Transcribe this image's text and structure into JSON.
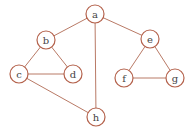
{
  "graph": {
    "nodes": [
      {
        "id": "a",
        "label": "a",
        "x": 95,
        "y": 14
      },
      {
        "id": "b",
        "label": "b",
        "x": 46,
        "y": 40
      },
      {
        "id": "c",
        "label": "c",
        "x": 19,
        "y": 74
      },
      {
        "id": "d",
        "label": "d",
        "x": 73,
        "y": 74
      },
      {
        "id": "e",
        "label": "e",
        "x": 150,
        "y": 39
      },
      {
        "id": "f",
        "label": "f",
        "x": 124,
        "y": 78
      },
      {
        "id": "g",
        "label": "g",
        "x": 175,
        "y": 78
      },
      {
        "id": "h",
        "label": "h",
        "x": 96,
        "y": 117
      }
    ],
    "edges": [
      [
        "a",
        "b"
      ],
      [
        "a",
        "e"
      ],
      [
        "a",
        "h"
      ],
      [
        "b",
        "c"
      ],
      [
        "b",
        "d"
      ],
      [
        "c",
        "d"
      ],
      [
        "c",
        "h"
      ],
      [
        "e",
        "f"
      ],
      [
        "e",
        "g"
      ],
      [
        "f",
        "g"
      ]
    ],
    "node_radius": 9,
    "colors": {
      "edge": "#b97a66",
      "node_border": "#b4624c",
      "label": "#444444"
    }
  }
}
